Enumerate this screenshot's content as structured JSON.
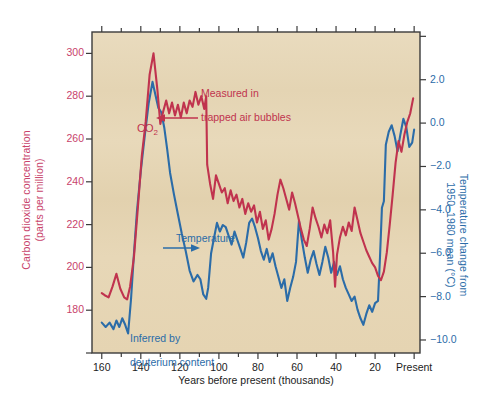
{
  "figure": {
    "background": "#ffffff",
    "plot_background": "#e6d6b8",
    "co2_color": "#c0334e",
    "temp_color": "#2b6ca8",
    "axis_color": "#3a3a3a"
  },
  "axes": {
    "left": {
      "title": "Carbon dioxide concentration\n(parts per million)",
      "title_line1": "Carbon dioxide concentration",
      "title_line2": "(parts per million)",
      "tick_labels": [
        "300",
        "280",
        "260",
        "240",
        "220",
        "200",
        "180"
      ],
      "tick_values": [
        300,
        280,
        260,
        240,
        220,
        200,
        180
      ],
      "color": "#c8436b"
    },
    "right": {
      "title": "Temperature change from\n1950–1980 mean (°C)",
      "title_line1": "Temperature change from",
      "title_line2": "1950–1980 mean (°C)",
      "tick_labels": [
        "2.0",
        "0.0",
        "−2.0",
        "−4.0",
        "−6.0",
        "−8.0",
        "−10.0"
      ],
      "tick_values": [
        2.0,
        0.0,
        -2.0,
        -4.0,
        -6.0,
        -8.0,
        -10.0
      ],
      "color": "#2b6ca8"
    },
    "bottom": {
      "title": "Years before present (thousands)",
      "tick_labels": [
        "160",
        "140",
        "120",
        "100",
        "80",
        "60",
        "40",
        "20",
        "Present"
      ],
      "tick_values": [
        160,
        140,
        120,
        100,
        80,
        60,
        40,
        20,
        0
      ],
      "color": "#1c1c1c"
    }
  },
  "annotations": {
    "co2_label": "CO",
    "co2_label_sub": "2",
    "co2_note": "Measured in\ntrapped air bubbles",
    "co2_note_line1": "Measured in",
    "co2_note_line2": "trapped air bubbles",
    "temp_label": "Temperature",
    "temp_note": "Inferred by\ndeuterium content",
    "temp_note_line1": "Inferred by",
    "temp_note_line2": "deuterium content"
  },
  "chart_data": {
    "type": "line",
    "title": "",
    "xlabel": "Years before present (thousands)",
    "ylabel": "Carbon dioxide concentration (parts per million)",
    "y2label": "Temperature change from 1950–1980 mean (°C)",
    "xlim": [
      165,
      -3
    ],
    "xlim_note": "x axis runs right-to-left: 160 kyr BP on the left, Present on the right",
    "ylim": [
      160,
      310
    ],
    "y2lim": [
      -10.6,
      4.2
    ],
    "grid": false,
    "legend": "none (inline annotations)",
    "series": [
      {
        "name": "CO2",
        "axis": "left",
        "units": "ppm",
        "color": "#c0334e",
        "x": [
          160.0,
          158.5,
          156.5,
          154.5,
          152.5,
          150.5,
          148.5,
          147.0,
          145.5,
          143.5,
          141.5,
          139.5,
          137.5,
          135.5,
          133.5,
          131.5,
          130.0,
          128.5,
          127.0,
          125.5,
          124.0,
          122.5,
          121.0,
          119.5,
          118.0,
          116.5,
          115.0,
          113.5,
          112.0,
          110.5,
          109.0,
          107.5,
          106.5,
          106.0,
          104.5,
          103.0,
          101.5,
          100.0,
          98.5,
          97.0,
          95.5,
          94.0,
          92.5,
          91.0,
          89.5,
          88.0,
          86.5,
          85.0,
          83.5,
          82.0,
          80.5,
          79.0,
          77.5,
          76.0,
          74.5,
          73.0,
          71.5,
          70.0,
          68.5,
          67.0,
          65.5,
          64.0,
          62.5,
          61.0,
          59.5,
          58.0,
          56.5,
          55.0,
          53.5,
          52.0,
          50.5,
          49.0,
          47.5,
          46.0,
          44.5,
          43.0,
          41.5,
          40.5,
          39.5,
          38.0,
          36.5,
          35.0,
          33.5,
          32.0,
          30.5,
          29.0,
          27.5,
          26.0,
          24.5,
          23.0,
          21.5,
          20.0,
          18.5,
          17.0,
          15.5,
          14.0,
          12.5,
          11.0,
          9.5,
          8.0,
          6.5,
          5.0,
          3.5,
          2.0,
          0.5
        ],
        "values": [
          188,
          187,
          186,
          191,
          197,
          190,
          186,
          185,
          191,
          205,
          228,
          252,
          268,
          290,
          300,
          283,
          267,
          273,
          278,
          272,
          277,
          271,
          276,
          270,
          277,
          272,
          278,
          275,
          282,
          276,
          280,
          274,
          280,
          248,
          239,
          232,
          243,
          239,
          235,
          237,
          230,
          236,
          231,
          234,
          228,
          232,
          225,
          230,
          226,
          229,
          221,
          226,
          218,
          222,
          213,
          218,
          225,
          234,
          241,
          237,
          232,
          227,
          235,
          230,
          224,
          218,
          213,
          210,
          218,
          228,
          223,
          219,
          214,
          220,
          216,
          222,
          207,
          191,
          206,
          214,
          219,
          215,
          221,
          217,
          228,
          222,
          216,
          212,
          208,
          205,
          202,
          200,
          196,
          194,
          198,
          207,
          220,
          234,
          249,
          259,
          254,
          262,
          268,
          272,
          279
        ]
      },
      {
        "name": "Temperature",
        "axis": "right",
        "units": "°C anomaly vs 1950–1980 mean",
        "color": "#2b6ca8",
        "x": [
          160.0,
          158.0,
          156.0,
          154.0,
          152.5,
          151.0,
          149.5,
          148.0,
          146.5,
          145.0,
          143.5,
          142.0,
          140.0,
          138.0,
          136.0,
          134.0,
          132.5,
          131.0,
          129.5,
          128.0,
          126.5,
          125.0,
          123.0,
          121.0,
          119.0,
          117.0,
          115.0,
          113.0,
          111.0,
          109.5,
          108.0,
          106.5,
          105.5,
          104.0,
          102.5,
          101.0,
          99.5,
          98.0,
          96.5,
          95.0,
          93.5,
          92.0,
          90.5,
          89.0,
          87.5,
          86.0,
          84.5,
          83.0,
          81.5,
          80.0,
          78.5,
          77.0,
          75.5,
          74.0,
          72.5,
          71.0,
          69.5,
          68.0,
          66.5,
          65.0,
          63.5,
          62.0,
          60.5,
          59.0,
          57.5,
          56.0,
          54.5,
          53.0,
          51.5,
          50.0,
          48.5,
          47.0,
          45.5,
          44.0,
          42.5,
          41.0,
          39.5,
          38.0,
          36.5,
          35.0,
          33.5,
          32.0,
          30.5,
          29.0,
          27.5,
          26.0,
          24.5,
          23.0,
          21.5,
          20.0,
          18.5,
          17.5,
          16.5,
          15.5,
          14.5,
          13.0,
          11.5,
          10.0,
          8.5,
          7.0,
          5.5,
          4.0,
          2.5,
          1.0,
          0.0
        ],
        "values": [
          -9.2,
          -9.4,
          -9.2,
          -9.5,
          -9.1,
          -9.4,
          -9.0,
          -9.3,
          -9.7,
          -8.1,
          -6.0,
          -4.1,
          -2.2,
          -0.6,
          0.9,
          1.9,
          1.3,
          0.7,
          0.5,
          -0.2,
          -1.2,
          -2.3,
          -3.3,
          -4.2,
          -5.1,
          -5.9,
          -6.8,
          -7.3,
          -7.0,
          -7.2,
          -7.9,
          -8.1,
          -7.6,
          -6.0,
          -5.3,
          -4.6,
          -5.0,
          -4.7,
          -4.8,
          -5.2,
          -5.6,
          -5.0,
          -5.4,
          -5.8,
          -6.2,
          -5.5,
          -4.6,
          -4.4,
          -4.8,
          -5.3,
          -5.9,
          -6.3,
          -5.8,
          -6.4,
          -6.0,
          -6.6,
          -7.1,
          -7.6,
          -7.2,
          -8.2,
          -7.6,
          -7.1,
          -6.4,
          -4.5,
          -5.4,
          -6.2,
          -6.9,
          -6.3,
          -5.9,
          -6.5,
          -7.0,
          -6.4,
          -5.7,
          -6.2,
          -6.9,
          -6.4,
          -7.0,
          -6.6,
          -7.2,
          -7.6,
          -7.9,
          -8.2,
          -8.0,
          -8.6,
          -9.0,
          -9.3,
          -8.8,
          -8.4,
          -8.7,
          -8.3,
          -8.2,
          -6.2,
          -3.9,
          -3.6,
          -1.0,
          -0.4,
          -0.1,
          -0.6,
          -1.3,
          -0.5,
          0.2,
          -0.2,
          -1.1,
          -0.9,
          -0.3
        ]
      }
    ]
  }
}
